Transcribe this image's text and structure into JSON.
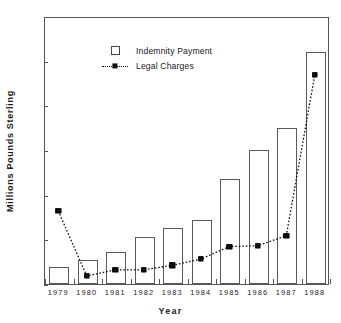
{
  "chart_data": {
    "type": "bar",
    "title": "",
    "subtitle": "",
    "xlabel": "Year",
    "ylabel": "Millions  Pounds  Sterling",
    "categories": [
      "1979",
      "1980",
      "1981",
      "1982",
      "1983",
      "1984",
      "1985",
      "1986",
      "1987",
      "1988"
    ],
    "ylim": [
      0,
      30
    ],
    "yticks": [
      0,
      5,
      10,
      15,
      20,
      25,
      30
    ],
    "ytick_labels": [
      "0",
      "5",
      "10",
      "15",
      "20",
      "25",
      "30"
    ],
    "grid": false,
    "legend_position": "upper-center-left",
    "series": [
      {
        "name": "Indemnity Payment",
        "type": "bar",
        "marker": "open-square",
        "values": [
          1.9,
          2.7,
          3.6,
          5.3,
          6.3,
          7.2,
          11.7,
          15.0,
          17.5,
          26.0
        ]
      },
      {
        "name": "Legal Charges",
        "type": "line",
        "marker": "filled-square",
        "linestyle": "dotted",
        "values": [
          8.3,
          1.0,
          1.7,
          1.7,
          2.2,
          2.9,
          4.3,
          4.4,
          5.5,
          23.5
        ]
      }
    ],
    "colors": {
      "axis": "#555555",
      "bar_edge": "#5a5a5a",
      "bar_fill": "#ffffff",
      "line": "#111111",
      "marker": "#111111",
      "text": "#1a1a1a",
      "background": "#ffffff"
    }
  },
  "legend": {
    "items": [
      {
        "label": "Indemnity Payment",
        "key": "open-square-icon"
      },
      {
        "label": "Legal Charges",
        "key": "dotted-line-square-icon"
      }
    ]
  },
  "axes": {
    "x_title": "Year",
    "y_title": "Millions  Pounds  Sterling"
  }
}
